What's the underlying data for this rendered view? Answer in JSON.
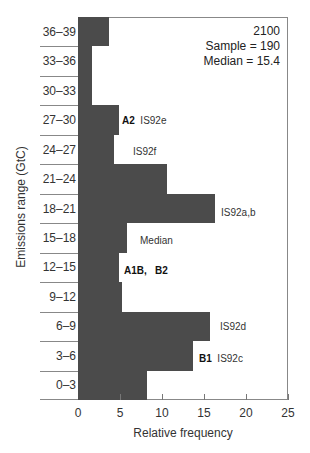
{
  "chart_data": {
    "type": "bar",
    "orientation": "horizontal",
    "title": "",
    "xlabel": "Relative frequency",
    "ylabel": "Emissions range (GtC)",
    "xlim": [
      0,
      25
    ],
    "xticks": [
      "0",
      "5",
      "10",
      "15",
      "20",
      "25"
    ],
    "grid": false,
    "categories": [
      "36–39",
      "33–36",
      "30–33",
      "27–30",
      "24–27",
      "21–24",
      "18–21",
      "15–18",
      "12–15",
      "9–12",
      "6–9",
      "3–6",
      "0–3"
    ],
    "values": [
      3.7,
      1.7,
      1.7,
      4.9,
      4.3,
      10.6,
      16.3,
      5.8,
      4.9,
      5.2,
      15.7,
      13.7,
      8.2
    ],
    "info_box": {
      "year": "2100",
      "sample": "Sample = 190",
      "median": "Median = 15.4"
    },
    "annotations": [
      {
        "category": "27–30",
        "bold": "A2",
        "text": "IS92e"
      },
      {
        "category": "24–27",
        "bold": "",
        "text": "IS92f"
      },
      {
        "category": "18–21",
        "bold": "",
        "text": "IS92a,b"
      },
      {
        "category": "15–18",
        "bold": "",
        "text": "Median"
      },
      {
        "category": "12–15",
        "bold": "A1B,   B2",
        "text": ""
      },
      {
        "category": "6–9",
        "bold": "",
        "text": "IS92d"
      },
      {
        "category": "3–6",
        "bold": "B1",
        "text": "IS92c"
      }
    ],
    "bar_color": "#4b4b4b"
  }
}
